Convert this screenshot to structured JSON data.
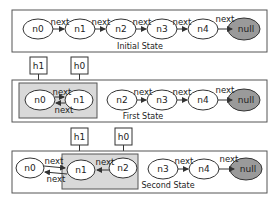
{
  "diagram": {
    "edge_label": "next",
    "states": [
      {
        "caption": "Initial State",
        "nodes": [
          "n0",
          "n1",
          "n2",
          "n3",
          "n4",
          "null"
        ]
      },
      {
        "caption": "First State",
        "pointers": [
          "h1",
          "h0"
        ],
        "nodes": [
          "n0",
          "n1",
          "n2",
          "n3",
          "n4",
          "null"
        ]
      },
      {
        "caption": "Second State",
        "pointers": [
          "h1",
          "h0"
        ],
        "nodes": [
          "n0",
          "n1",
          "n2",
          "n3",
          "n4",
          "null"
        ]
      }
    ],
    "colors": {
      "null_fill": "#9a9a9a",
      "shade_fill": "#d9d9d9"
    }
  }
}
